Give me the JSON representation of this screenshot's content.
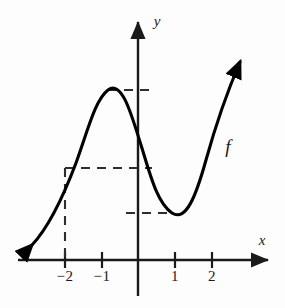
{
  "figure": {
    "kind": "function-graph",
    "background_color": "#fdfdfd",
    "ink_color": "#1a1a1a",
    "curve_color": "#000000",
    "dash_color": "#3a3a3a"
  },
  "axes": {
    "x_label": "x",
    "y_label": "y",
    "origin_px": {
      "x": 138,
      "y": 260
    },
    "unit_px": 37,
    "x_ticks": [
      {
        "value": -2,
        "label": "−2",
        "px": 65
      },
      {
        "value": -1,
        "label": "−1",
        "px": 102
      },
      {
        "value": 1,
        "label": "1",
        "px": 175
      },
      {
        "value": 2,
        "label": "2",
        "px": 212
      }
    ],
    "y_ticks": []
  },
  "curve": {
    "label": "f",
    "label_px": {
      "x": 228,
      "y": 147
    },
    "path": "M 32 245 C 48 228, 62 200, 76 163 C 88 130, 95 100, 108 90 C 122 80, 131 113, 141 145 C 150 174, 157 203, 172 213 C 186 222, 196 196, 206 160 C 216 124, 228 90, 240 62",
    "start_arrow": {
      "x": 32,
      "y": 245,
      "direction": "down-left"
    },
    "end_arrow": {
      "x": 240,
      "y": 62,
      "direction": "up-right"
    }
  },
  "guides": [
    {
      "name": "local-max-level",
      "type": "horizontal-dashed",
      "y_px": 90,
      "x_start_px": 108,
      "x_end_px": 152
    },
    {
      "name": "f-of-negative-two-level",
      "type": "horizontal-dashed",
      "y_px": 168,
      "x_start_px": 65,
      "x_end_px": 152
    },
    {
      "name": "x-equals-negative-two",
      "type": "vertical-dashed",
      "x_px": 65,
      "y_start_px": 168,
      "y_end_px": 260
    },
    {
      "name": "local-min-level",
      "type": "horizontal-dashed",
      "y_px": 213,
      "x_start_px": 126,
      "x_end_px": 174
    }
  ],
  "chart_data": {
    "type": "line",
    "title": "",
    "xlabel": "x",
    "ylabel": "y",
    "legend": [
      "f"
    ],
    "grid": false,
    "xlim": [
      -2.9,
      3.6
    ],
    "ylim": [
      -0.5,
      5.4
    ],
    "series": [
      {
        "name": "f",
        "x": [
          -2.9,
          -2.5,
          -2.0,
          -1.7,
          -1.4,
          -1.0,
          -0.6,
          -0.2,
          0.0,
          0.35,
          0.7,
          1.0,
          1.35,
          1.7,
          2.0,
          2.4,
          2.8
        ],
        "y": [
          0.4,
          1.3,
          2.5,
          3.3,
          4.2,
          4.6,
          4.0,
          3.1,
          2.5,
          1.8,
          1.4,
          1.27,
          1.6,
          2.5,
          3.4,
          4.4,
          5.35
        ]
      }
    ],
    "annotations": [
      {
        "text": "f",
        "x": 2.45,
        "y": 3.05,
        "note": "curve label"
      },
      {
        "text": "local maximum",
        "x": -1.0,
        "y": 4.6
      },
      {
        "text": "local minimum",
        "x": 1.0,
        "y": 1.27
      },
      {
        "text": "value at x = -2",
        "x": -2.0,
        "y": 2.5
      }
    ]
  }
}
